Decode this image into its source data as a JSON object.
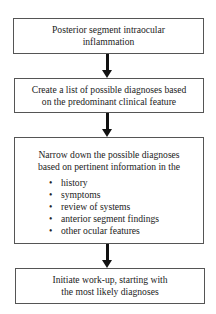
{
  "flowchart": {
    "steps": [
      {
        "lines": [
          "Posterior segment intraocular",
          "inflammation"
        ]
      },
      {
        "lines": [
          "Create a list of possible diagnoses based",
          "on the predominant clinical feature"
        ]
      },
      {
        "lines": [
          "Narrow down the possible diagnoses",
          "based on pertinent information in the"
        ],
        "bullets": [
          "history",
          "symptoms",
          "review of systems",
          "anterior segment findings",
          "other ocular features"
        ]
      },
      {
        "lines": [
          "Initiate work-up, starting with",
          "the most likely diagnoses"
        ]
      }
    ],
    "bullet_glyph": "•",
    "colors": {
      "border": "#555555",
      "arrow": "#111111",
      "text": "#222222",
      "background": "#ffffff"
    }
  }
}
